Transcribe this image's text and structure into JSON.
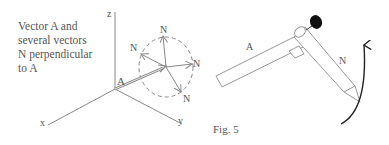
{
  "figure": {
    "caption_label": "Fig. 5",
    "description_lines": [
      "Vector A and",
      "several vectors",
      "N  perpendicular",
      "to A"
    ]
  },
  "left_diagram": {
    "axes": {
      "x_label": "x",
      "y_label": "y",
      "z_label": "z"
    },
    "vector_a_label": "A",
    "normal_vector_labels": [
      "N",
      "N",
      "N",
      "N"
    ],
    "circle_style": "dashed"
  },
  "right_diagram": {
    "rod_a_label": "A",
    "pencil_n_label": "N",
    "rotation_arrow": "curved-arrow-counterclockwise"
  },
  "colors": {
    "line": "#888888",
    "text": "#555555",
    "knob": "#111111",
    "arrow": "#222222",
    "background": "#ffffff"
  }
}
